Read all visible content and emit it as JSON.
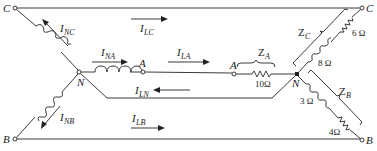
{
  "diagram": {
    "type": "three-phase Y-Y circuit with neutral",
    "nodes": {
      "source_c": "C",
      "source_b": "B",
      "source_neutral": "N",
      "source_a": "A",
      "load_a": "A",
      "load_neutral": "N",
      "load_c": "C",
      "load_b": "B"
    },
    "currents": {
      "i_nc": {
        "main": "I",
        "sub": "NC"
      },
      "i_lc": {
        "main": "I",
        "sub": "LC"
      },
      "i_na": {
        "main": "I",
        "sub": "NA"
      },
      "i_la": {
        "main": "I",
        "sub": "LA"
      },
      "i_ln": {
        "main": "I",
        "sub": "LN"
      },
      "i_nb": {
        "main": "I",
        "sub": "NB"
      },
      "i_lb": {
        "main": "I",
        "sub": "LB"
      }
    },
    "impedances": {
      "z_a": {
        "main": "Z",
        "sub": "A",
        "resistor": "10Ω"
      },
      "z_c": {
        "main": "Z",
        "sub": "C",
        "resistor": "6 Ω",
        "inductor": "8 Ω"
      },
      "z_b": {
        "main": "Z",
        "sub": "B",
        "inductor": "3 Ω",
        "resistor": "4Ω"
      }
    }
  }
}
